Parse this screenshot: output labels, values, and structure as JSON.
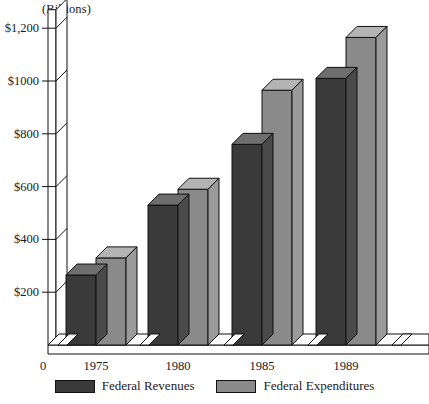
{
  "chart_data": {
    "type": "bar",
    "title": "",
    "unit_label": "(Billions)",
    "xlabel": "",
    "ylabel": "",
    "grid": false,
    "legend_position": "bottom",
    "style": "3d-grouped-column",
    "categories": [
      "1975",
      "1980",
      "1985",
      "1989"
    ],
    "series": [
      {
        "name": "Federal Revenues",
        "color": "#3a3a3a",
        "values": [
          265,
          530,
          760,
          1010
        ]
      },
      {
        "name": "Federal Expenditures",
        "color": "#8a8a8a",
        "values": [
          330,
          590,
          965,
          1165
        ]
      }
    ],
    "ylim": [
      0,
      1270
    ],
    "yticks": [
      200,
      400,
      600,
      800,
      1000,
      1200
    ],
    "ytick_labels": [
      "$200",
      "$400",
      "$600",
      "$800",
      "$1000",
      "$1,200"
    ],
    "origin_label": "0"
  },
  "legend": {
    "items": [
      {
        "label": "Federal Revenues",
        "color": "#3a3a3a"
      },
      {
        "label": "Federal Expenditures",
        "color": "#8a8a8a"
      }
    ]
  },
  "colors": {
    "revenue_front": "#3a3a3a",
    "revenue_top": "#6e6e6e",
    "revenue_side": "#4a4a4a",
    "expenditure_front": "#8a8a8a",
    "expenditure_top": "#b4b4b4",
    "expenditure_side": "#9a9a9a",
    "axis_line": "#111111",
    "axis_fill": "#ffffff",
    "background": "#ffffff"
  }
}
